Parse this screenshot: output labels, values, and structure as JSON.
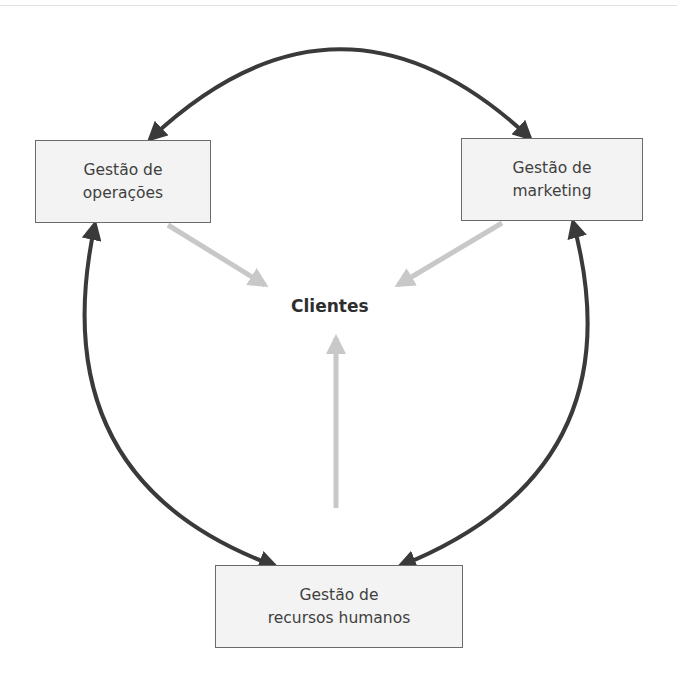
{
  "diagram": {
    "center": {
      "label": "Clientes"
    },
    "nodes": [
      {
        "id": "operacoes",
        "line1": "Gestão de",
        "line2": "operações"
      },
      {
        "id": "marketing",
        "line1": "Gestão de",
        "line2": "marketing"
      },
      {
        "id": "rh",
        "line1": "Gestão de",
        "line2": "recursos humanos"
      }
    ],
    "edges": [
      {
        "from": "operacoes",
        "to": "marketing",
        "type": "bidirectional-curve"
      },
      {
        "from": "operacoes",
        "to": "rh",
        "type": "bidirectional-curve"
      },
      {
        "from": "marketing",
        "to": "rh",
        "type": "bidirectional-curve"
      },
      {
        "from": "operacoes",
        "to": "Clientes",
        "type": "light-arrow"
      },
      {
        "from": "marketing",
        "to": "Clientes",
        "type": "light-arrow"
      },
      {
        "from": "rh",
        "to": "Clientes",
        "type": "light-arrow"
      }
    ],
    "colors": {
      "cycle_arrow": "#3a3a3a",
      "client_arrow": "#c8c8c8",
      "box_fill": "#f3f3f3",
      "box_border": "#6a6a6a"
    }
  }
}
